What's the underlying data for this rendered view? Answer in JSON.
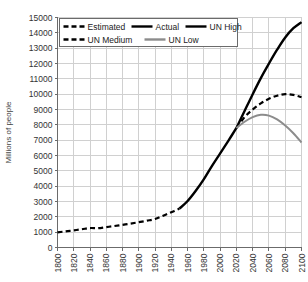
{
  "chart_data": {
    "type": "line",
    "title": "",
    "subtitle": "",
    "xlabel": "",
    "ylabel": "Millions of people",
    "xlim": [
      1800,
      2100
    ],
    "ylim": [
      0,
      15000
    ],
    "grid": true,
    "legend_position": "top-left",
    "xticks": [
      "1800",
      "1820",
      "1840",
      "1860",
      "1880",
      "1900",
      "1920",
      "1940",
      "1960",
      "1980",
      "2000",
      "2020",
      "2040",
      "2060",
      "2080",
      "2100"
    ],
    "yticks": [
      "0",
      "1000",
      "2000",
      "3000",
      "4000",
      "5000",
      "6000",
      "7000",
      "8000",
      "9000",
      "10000",
      "11000",
      "12000",
      "13000",
      "14000",
      "15000"
    ],
    "series": [
      {
        "name": "Estimated",
        "style": "dashed",
        "color": "#000000",
        "width": 2.2,
        "x": [
          1800,
          1810,
          1820,
          1830,
          1840,
          1850,
          1860,
          1870,
          1880,
          1890,
          1900,
          1910,
          1920,
          1930,
          1940,
          1950
        ],
        "values": [
          990,
          1050,
          1120,
          1190,
          1270,
          1260,
          1330,
          1400,
          1480,
          1560,
          1650,
          1750,
          1860,
          2070,
          2300,
          2536
        ]
      },
      {
        "name": "Actual",
        "style": "solid",
        "color": "#000000",
        "width": 2.4,
        "x": [
          1950,
          1960,
          1970,
          1980,
          1990,
          2000,
          2010,
          2020
        ],
        "values": [
          2536,
          3034,
          3700,
          4458,
          5327,
          6143,
          6957,
          7795
        ]
      },
      {
        "name": "UN High",
        "style": "solid",
        "color": "#000000",
        "width": 2.4,
        "x": [
          2020,
          2030,
          2040,
          2050,
          2060,
          2070,
          2080,
          2090,
          2100
        ],
        "values": [
          7795,
          8900,
          10000,
          11050,
          12000,
          12900,
          13700,
          14300,
          14700
        ]
      },
      {
        "name": "UN Medium",
        "style": "dashed",
        "color": "#000000",
        "width": 2.2,
        "x": [
          2020,
          2030,
          2040,
          2050,
          2060,
          2070,
          2080,
          2090,
          2100
        ],
        "values": [
          7795,
          8500,
          9000,
          9400,
          9700,
          9900,
          10000,
          9950,
          9800
        ]
      },
      {
        "name": "UN Low",
        "style": "solid",
        "color": "#8c8c8c",
        "width": 2.0,
        "x": [
          2020,
          2030,
          2040,
          2050,
          2060,
          2070,
          2080,
          2090,
          2100
        ],
        "values": [
          7795,
          8200,
          8500,
          8650,
          8600,
          8350,
          7950,
          7450,
          6850
        ]
      }
    ],
    "legend": [
      {
        "label": "Estimated",
        "style": "dashed",
        "color": "#000000"
      },
      {
        "label": "Actual",
        "style": "solid",
        "color": "#000000"
      },
      {
        "label": "UN High",
        "style": "solid",
        "color": "#000000"
      },
      {
        "label": "UN Medium",
        "style": "dashed",
        "color": "#000000"
      },
      {
        "label": "UN Low",
        "style": "solid",
        "color": "#8c8c8c"
      }
    ],
    "colors": {
      "grid": "#d0d0d0",
      "axis": "#6b6b6b",
      "text": "#333333",
      "background": "#ffffff",
      "un_low": "#8c8c8c"
    }
  }
}
